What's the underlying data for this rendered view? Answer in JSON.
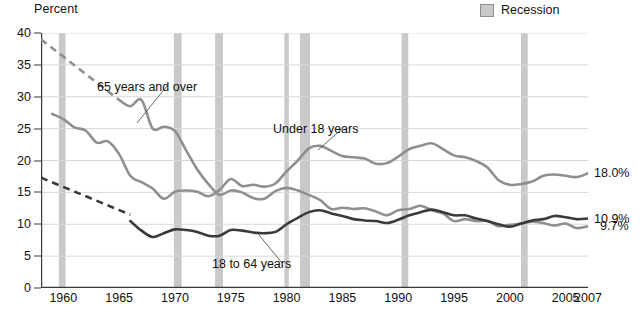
{
  "chart_data": {
    "type": "line",
    "title": "",
    "ylabel": "Percent",
    "xlabel": "",
    "ylim": [
      0,
      40
    ],
    "xlim": [
      1958,
      2007
    ],
    "yticks": [
      0,
      5,
      10,
      15,
      20,
      25,
      30,
      35,
      40
    ],
    "xticks": [
      1960,
      1965,
      1970,
      1975,
      1980,
      1985,
      1990,
      1995,
      2000,
      2005,
      2007
    ],
    "xtick_labels": [
      "1960",
      "1965",
      "1970",
      "1975",
      "1980",
      "1985",
      "1990",
      "1995",
      "2000",
      "2005",
      "2007"
    ],
    "minor_xtick_interval": 1,
    "grid": "horizontal",
    "legend_position": "top-right",
    "legend": [
      {
        "label": "Recession",
        "color": "#c9c9c9",
        "type": "band"
      }
    ],
    "series": [
      {
        "name": "65 years and over",
        "color": "#8f8f8f",
        "width": 2.6,
        "label_text": "65 years and over",
        "end_value_label": "9.7%",
        "dashed_segment": {
          "x": [
            1958,
            1965
          ],
          "y": [
            39.0,
            29.5
          ]
        },
        "x": [
          1959,
          1960,
          1961,
          1962,
          1963,
          1964,
          1965,
          1966,
          1967,
          1968,
          1969,
          1970,
          1971,
          1972,
          1973,
          1974,
          1975,
          1976,
          1977,
          1978,
          1979,
          1980,
          1981,
          1982,
          1983,
          1984,
          1985,
          1986,
          1987,
          1988,
          1989,
          1990,
          1991,
          1992,
          1993,
          1994,
          1995,
          1996,
          1997,
          1998,
          1999,
          2000,
          2001,
          2002,
          2003,
          2004,
          2005,
          2006,
          2007
        ],
        "y": [
          35.2,
          35.2,
          35.2,
          35.2,
          35.2,
          35.2,
          29.5,
          28.5,
          29.5,
          25.0,
          25.3,
          24.6,
          21.6,
          18.6,
          16.3,
          14.6,
          15.3,
          15.0,
          14.1,
          14.0,
          15.2,
          15.7,
          15.3,
          14.6,
          13.8,
          12.4,
          12.6,
          12.4,
          12.5,
          12.0,
          11.4,
          12.2,
          12.4,
          12.9,
          12.2,
          11.7,
          10.5,
          10.8,
          10.5,
          10.5,
          9.7,
          9.9,
          10.1,
          10.4,
          10.2,
          9.8,
          10.1,
          9.4,
          9.7
        ]
      },
      {
        "name": "Under 18 years",
        "color": "#8f8f8f",
        "width": 2.6,
        "label_text": "Under 18 years",
        "end_value_label": "18.0%",
        "x": [
          1959,
          1960,
          1961,
          1962,
          1963,
          1964,
          1965,
          1966,
          1967,
          1968,
          1969,
          1970,
          1971,
          1972,
          1973,
          1974,
          1975,
          1976,
          1977,
          1978,
          1979,
          1980,
          1981,
          1982,
          1983,
          1984,
          1985,
          1986,
          1987,
          1988,
          1989,
          1990,
          1991,
          1992,
          1993,
          1994,
          1995,
          1996,
          1997,
          1998,
          1999,
          2000,
          2001,
          2002,
          2003,
          2004,
          2005,
          2006,
          2007
        ],
        "y": [
          27.3,
          26.5,
          25.2,
          24.7,
          22.8,
          23.0,
          21.0,
          17.6,
          16.6,
          15.6,
          14.0,
          15.1,
          15.3,
          15.1,
          14.4,
          15.4,
          17.1,
          16.0,
          16.2,
          15.9,
          16.4,
          18.3,
          20.0,
          21.9,
          22.3,
          21.5,
          20.7,
          20.5,
          20.3,
          19.5,
          19.6,
          20.6,
          21.8,
          22.3,
          22.7,
          21.8,
          20.8,
          20.5,
          19.9,
          18.9,
          16.9,
          16.2,
          16.3,
          16.7,
          17.6,
          17.8,
          17.6,
          17.4,
          18.0
        ]
      },
      {
        "name": "18 to 64 years",
        "color": "#3a3a3a",
        "width": 2.6,
        "label_text": "18 to 64 years",
        "end_value_label": "10.9%",
        "dashed_segment": {
          "x": [
            1958,
            1966
          ],
          "y": [
            17.3,
            11.5
          ]
        },
        "x": [
          1966,
          1967,
          1968,
          1969,
          1970,
          1971,
          1972,
          1973,
          1974,
          1975,
          1976,
          1977,
          1978,
          1979,
          1980,
          1981,
          1982,
          1983,
          1984,
          1985,
          1986,
          1987,
          1988,
          1989,
          1990,
          1991,
          1992,
          1993,
          1994,
          1995,
          1996,
          1997,
          1998,
          1999,
          2000,
          2001,
          2002,
          2003,
          2004,
          2005,
          2006,
          2007
        ],
        "y": [
          10.5,
          9.0,
          8.0,
          8.6,
          9.2,
          9.1,
          8.8,
          8.2,
          8.2,
          9.1,
          9.0,
          8.7,
          8.6,
          8.8,
          10.0,
          11.0,
          11.9,
          12.2,
          11.7,
          11.3,
          10.8,
          10.6,
          10.5,
          10.2,
          10.7,
          11.4,
          11.9,
          12.3,
          11.9,
          11.4,
          11.4,
          10.9,
          10.5,
          10.0,
          9.6,
          10.1,
          10.6,
          10.8,
          11.3,
          11.1,
          10.8,
          10.9
        ]
      }
    ],
    "recession_bands": [
      {
        "start": 1959.6,
        "end": 1960.2,
        "label": "Recession"
      },
      {
        "start": 1969.9,
        "end": 1970.6,
        "label": "Recession"
      },
      {
        "start": 1973.6,
        "end": 1974.3,
        "label": "Recession"
      },
      {
        "start": 1979.8,
        "end": 1980.2,
        "label": "Recession"
      },
      {
        "start": 1981.2,
        "end": 1982.1,
        "label": "Recession"
      },
      {
        "start": 1990.3,
        "end": 1990.9,
        "label": "Recession"
      },
      {
        "start": 2001.0,
        "end": 2001.6,
        "label": "Recession"
      }
    ],
    "annotations": [
      {
        "text": "65 years and over",
        "x_px": 97,
        "y_px": 80,
        "leader_to_x": 137,
        "leader_to_y": 123
      },
      {
        "text": "Under 18 years",
        "x_px": 273,
        "y_px": 122,
        "leader_to_x": 318,
        "leader_to_y": 150
      },
      {
        "text": "18 to 64 years",
        "x_px": 212,
        "y_px": 257,
        "leader_to_x": 259,
        "leader_to_y": 235
      }
    ],
    "end_value_labels": [
      {
        "text": "18.0%",
        "y_value": 18.0
      },
      {
        "text": "10.9%",
        "y_value": 10.9
      },
      {
        "text": "9.7%",
        "y_value": 9.7
      }
    ]
  },
  "axis": {
    "y_title": "Percent",
    "y_tick_labels": [
      "40",
      "35",
      "30",
      "25",
      "20",
      "15",
      "10",
      "5",
      "0"
    ],
    "x_tick_labels": [
      "1960",
      "1965",
      "1970",
      "1975",
      "1980",
      "1985",
      "1990",
      "1995",
      "2000",
      "2005",
      "2007"
    ]
  },
  "legend": {
    "recession_label": "Recession"
  },
  "colors": {
    "recession_band": "#c9c9c9",
    "grid": "#d8d8d8",
    "axis": "#3a3a3a",
    "series_light": "#8f8f8f",
    "series_dark": "#3a3a3a",
    "text": "#111111"
  }
}
